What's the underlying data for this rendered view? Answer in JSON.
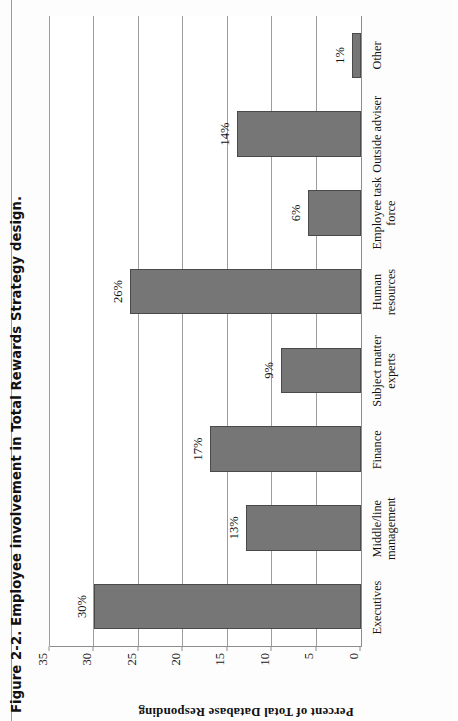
{
  "figure": {
    "caption": "Figure 2-2. Employee involvement in Total Rewards Strategy design."
  },
  "chart_data": {
    "type": "bar",
    "orientation": "vertical-column-chart-rotated-90ccw-on-page",
    "title": "Figure 2-2. Employee involvement in Total Rewards Strategy design.",
    "categories": [
      "Executives",
      "Middle/line management",
      "Finance",
      "Subject matter experts",
      "Human resources",
      "Employee task force",
      "Outside adviser",
      "Other"
    ],
    "values": [
      30,
      13,
      17,
      9,
      26,
      6,
      14,
      1
    ],
    "value_labels": [
      "30%",
      "13%",
      "17%",
      "9%",
      "26%",
      "6%",
      "14%",
      "1%"
    ],
    "xlabel": "",
    "ylabel": "Percent of Total Database Responding",
    "ylim": [
      0,
      35
    ],
    "yticks": [
      0,
      5,
      10,
      15,
      20,
      25,
      30,
      35
    ],
    "ytick_labels": [
      "0",
      "5",
      "10",
      "15",
      "20",
      "25",
      "30",
      "35"
    ],
    "grid": true,
    "legend": false,
    "bar_color": "#767676",
    "bar_border_color": "#4a4a4a",
    "axis_color": "#8d8d8d",
    "background": "#ffffff"
  },
  "category_lines": [
    [
      "Executives"
    ],
    [
      "Middle/line",
      "management"
    ],
    [
      "Finance"
    ],
    [
      "Subject matter",
      "experts"
    ],
    [
      "Human",
      "resources"
    ],
    [
      "Employee task",
      "force"
    ],
    [
      "Outside adviser"
    ],
    [
      "Other"
    ]
  ]
}
